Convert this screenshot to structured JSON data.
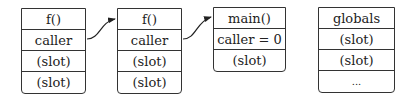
{
  "frames": [
    {
      "name": "frame-f-1",
      "rows": [
        "f()",
        "caller",
        "(slot)",
        "(slot)"
      ]
    },
    {
      "name": "frame-f-2",
      "rows": [
        "f()",
        "caller",
        "(slot)",
        "(slot)"
      ]
    },
    {
      "name": "frame-main",
      "rows": [
        "main()",
        "caller = 0",
        "(slot)"
      ]
    },
    {
      "name": "globals",
      "rows": [
        "globals",
        "(slot)",
        "(slot)",
        "..."
      ]
    }
  ],
  "arrows": [
    {
      "from": "frame-f-1.caller",
      "to": "frame-f-2"
    },
    {
      "from": "frame-f-2.caller",
      "to": "frame-main"
    }
  ]
}
